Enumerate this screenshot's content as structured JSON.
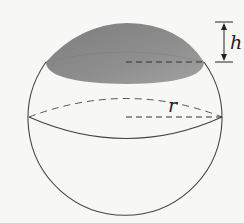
{
  "diagram": {
    "labels": {
      "height": "h",
      "radius": "r"
    },
    "colors": {
      "background": "#f7f7f5",
      "outline": "#444444",
      "cap_fill": "#8a8a8a",
      "cap_highlight": "#a0a0a0"
    }
  }
}
